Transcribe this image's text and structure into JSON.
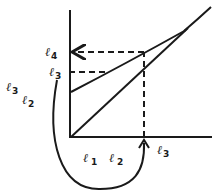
{
  "diagram": {
    "type": "function-iteration-graph",
    "colors": {
      "ink": "#1a1a1a",
      "background": "#ffffff"
    },
    "labels": {
      "l4_left": {
        "base": "ℓ",
        "sub": "4"
      },
      "l3_left": {
        "base": "ℓ",
        "sub": "3"
      },
      "l3_outer": {
        "base": "ℓ",
        "sub": "3"
      },
      "l2_outer": {
        "base": "ℓ",
        "sub": "2"
      },
      "l1_bottom": {
        "base": "ℓ",
        "sub": "1"
      },
      "l2_bottom": {
        "base": "ℓ",
        "sub": "2"
      },
      "l3_bottom": {
        "base": "ℓ",
        "sub": "3"
      }
    },
    "curves": [
      "diagonal line y=x",
      "map curve"
    ],
    "annotations": [
      "dashed projection from x-axis ℓ3 to curve",
      "dashed projection to y-axis ℓ4",
      "dashed projection ℓ3 level",
      "curved arrow from y-axis ℓ3 to x-axis ℓ3"
    ]
  }
}
